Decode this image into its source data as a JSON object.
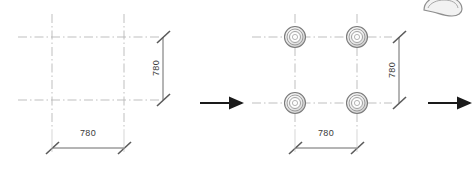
{
  "drawing": {
    "title": "column-grid-layout-transformation",
    "background_color": "#ffffff",
    "centerline_color": "#b8b8b8",
    "dimension_color": "#5a5a5a",
    "arrow_color": "#1a1a1a",
    "symbol_color": "#6e6e6e",
    "text_color": "#3a3a3a"
  },
  "panels": [
    {
      "id": "before",
      "name": "grid-only-panel",
      "grid": {
        "columns": 2,
        "rows": 2,
        "spacing_value": "780",
        "line_style": "dash-dot centerline"
      },
      "symbols": [],
      "dimensions": {
        "horizontal": {
          "label": "780",
          "terminator": "architectural-tick"
        },
        "vertical": {
          "label": "780",
          "terminator": "architectural-tick"
        }
      }
    },
    {
      "id": "after",
      "name": "grid-with-columns-panel",
      "grid": {
        "columns": 2,
        "rows": 2,
        "spacing_value": "780",
        "line_style": "dash-dot centerline"
      },
      "symbols": [
        {
          "name": "column-symbol",
          "position": "top-left",
          "rings": 4
        },
        {
          "name": "column-symbol",
          "position": "top-right",
          "rings": 4
        },
        {
          "name": "column-symbol",
          "position": "bottom-left",
          "rings": 4
        },
        {
          "name": "column-symbol",
          "position": "bottom-right",
          "rings": 4
        }
      ],
      "dimensions": {
        "horizontal": {
          "label": "780",
          "terminator": "architectural-tick"
        },
        "vertical": {
          "label": "780",
          "terminator": "architectural-tick"
        }
      }
    }
  ],
  "arrows": [
    {
      "name": "transition-arrow-middle",
      "direction": "right"
    },
    {
      "name": "transition-arrow-right",
      "direction": "right"
    }
  ],
  "decoration": {
    "name": "curved-shape-artifact",
    "description": "partial curved gray object at top right"
  },
  "labels": {
    "left_horizontal_dim": "780",
    "left_vertical_dim": "780",
    "right_horizontal_dim": "780",
    "right_vertical_dim": "780"
  }
}
